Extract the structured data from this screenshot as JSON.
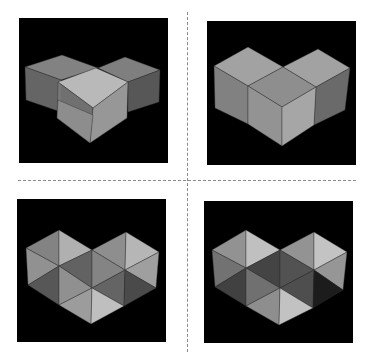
{
  "figure": {
    "background": "#ffffff",
    "divider_color": "#8a8a8a",
    "panels": [
      {
        "id": "top-left",
        "label": "three overlapping transparent cubes",
        "box": {
          "x": 19,
          "y": 18,
          "w": 149,
          "h": 145
        },
        "faces": [
          {
            "pts": "25,67 62,55 98,68 61,80",
            "fill": "#8d8d8d"
          },
          {
            "pts": "25,67 61,80 61,112 26,100",
            "fill": "#6e6e6e"
          },
          {
            "pts": "98,68 125,57 160,70 128,82",
            "fill": "#8a8a8a"
          },
          {
            "pts": "128,82 160,70 159,102 128,112",
            "fill": "#5e5e5e"
          },
          {
            "pts": "58,82 96,68 128,82 93,108",
            "fill": "#c9c9c9"
          },
          {
            "pts": "58,82 93,108 90,143 57,118",
            "fill": "#7a7a7a"
          },
          {
            "pts": "93,108 128,82 127,118 90,143",
            "fill": "#a4a4a4"
          },
          {
            "pts": "58,100 93,115 90,143 57,118",
            "fill": "#8f8f8f"
          }
        ]
      },
      {
        "id": "top-right",
        "label": "heart shape from three cubes",
        "box": {
          "x": 207,
          "y": 21,
          "w": 149,
          "h": 144
        },
        "faces": [
          {
            "pts": "214,66 248,47 283,67 248,86",
            "fill": "#b0b0b0"
          },
          {
            "pts": "283,67 318,49 350,68 316,87",
            "fill": "#b0b0b0"
          },
          {
            "pts": "214,66 248,86 248,124 215,108",
            "fill": "#8c8c8c"
          },
          {
            "pts": "248,86 283,67 316,87 282,107",
            "fill": "#9a9a9a"
          },
          {
            "pts": "316,87 350,68 345,110 314,125",
            "fill": "#737373"
          },
          {
            "pts": "248,86 282,107 282,146 248,124",
            "fill": "#a0a0a0"
          },
          {
            "pts": "282,107 316,87 314,125 282,146",
            "fill": "#b4b4b4"
          }
        ]
      },
      {
        "id": "bottom-left",
        "label": "heart mosaic of triangular facets",
        "box": {
          "x": 17,
          "y": 199,
          "w": 149,
          "h": 143
        },
        "faces": [
          {
            "pts": "26,248 59,230 59,266",
            "fill": "#8e8e8e"
          },
          {
            "pts": "59,230 92,250 59,266",
            "fill": "#bfbfbf"
          },
          {
            "pts": "92,250 126,232 125,270",
            "fill": "#9a9a9a"
          },
          {
            "pts": "126,232 159,252 125,270",
            "fill": "#c6c6c6"
          },
          {
            "pts": "26,248 59,266 28,285",
            "fill": "#9d9d9d"
          },
          {
            "pts": "59,266 92,250 92,288",
            "fill": "#6a6a6a"
          },
          {
            "pts": "92,250 125,270 92,288",
            "fill": "#8f8f8f"
          },
          {
            "pts": "125,270 159,252 156,288",
            "fill": "#adadad"
          },
          {
            "pts": "28,285 59,266 59,305",
            "fill": "#5e5e5e"
          },
          {
            "pts": "59,266 92,288 59,305",
            "fill": "#9c9c9c"
          },
          {
            "pts": "92,288 125,270 124,306",
            "fill": "#6c6c6c"
          },
          {
            "pts": "125,270 156,288 124,306",
            "fill": "#505050"
          },
          {
            "pts": "59,305 92,288 91,324",
            "fill": "#a9a9a9"
          },
          {
            "pts": "92,288 124,306 91,324",
            "fill": "#cfcfcf"
          }
        ]
      },
      {
        "id": "bottom-right",
        "label": "heart mosaic with darker shading",
        "box": {
          "x": 204,
          "y": 201,
          "w": 149,
          "h": 142
        },
        "faces": [
          {
            "pts": "212,250 246,230 246,268",
            "fill": "#9e9e9e"
          },
          {
            "pts": "246,230 280,250 246,268",
            "fill": "#d0d0d0"
          },
          {
            "pts": "280,250 314,232 314,270",
            "fill": "#a0a0a0"
          },
          {
            "pts": "314,232 347,252 314,270",
            "fill": "#d4d4d4"
          },
          {
            "pts": "212,250 246,268 215,287",
            "fill": "#7c7c7c"
          },
          {
            "pts": "246,268 280,250 280,288",
            "fill": "#4a4a4a"
          },
          {
            "pts": "280,250 314,270 280,288",
            "fill": "#595959"
          },
          {
            "pts": "314,270 347,252 343,290",
            "fill": "#a3a3a3"
          },
          {
            "pts": "215,287 246,268 246,306",
            "fill": "#474747"
          },
          {
            "pts": "246,268 280,288 246,306",
            "fill": "#7a7a7a"
          },
          {
            "pts": "280,288 314,270 313,308",
            "fill": "#555555"
          },
          {
            "pts": "314,270 343,290 313,308",
            "fill": "#1e1e1e"
          },
          {
            "pts": "246,306 280,288 279,325",
            "fill": "#9a9a9a"
          },
          {
            "pts": "280,288 313,308 279,325",
            "fill": "#d2d2d2"
          }
        ]
      }
    ]
  }
}
